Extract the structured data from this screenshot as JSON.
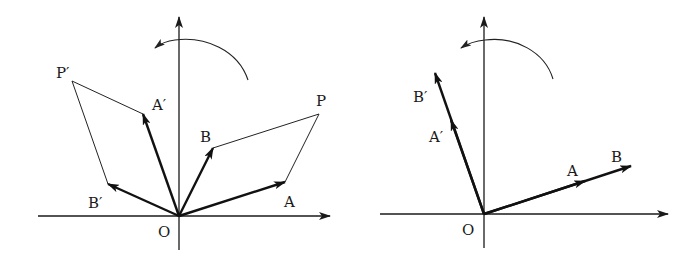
{
  "figure": {
    "colors": {
      "ink": "#111111",
      "background": "#ffffff"
    }
  },
  "left_panel": {
    "origin_label": "O",
    "labels": {
      "A": "A",
      "B": "B",
      "P": "P",
      "A_prime": "A′",
      "B_prime": "B′",
      "P_prime": "P′"
    },
    "rotation_direction": "counterclockwise"
  },
  "right_panel": {
    "origin_label": "O",
    "labels": {
      "A": "A",
      "B": "B",
      "A_prime": "A′",
      "B_prime": "B′"
    },
    "rotation_direction": "counterclockwise"
  }
}
